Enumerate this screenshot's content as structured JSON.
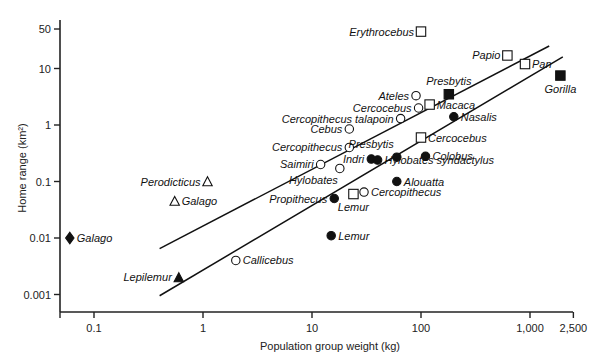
{
  "chart_data": {
    "type": "scatter",
    "title": "",
    "xlabel": "Population group weight (kg)",
    "ylabel": "Home range (km²)",
    "xscale": "log",
    "yscale": "log",
    "xlim": [
      0.05,
      2500
    ],
    "ylim": [
      0.0005,
      60
    ],
    "x_ticks": [
      {
        "value": 0.1,
        "label": "0.1"
      },
      {
        "value": 1,
        "label": "1"
      },
      {
        "value": 10,
        "label": "10"
      },
      {
        "value": 100,
        "label": "100"
      },
      {
        "value": 1000,
        "label": "1,000"
      },
      {
        "value": 2500,
        "label": "2,500"
      }
    ],
    "y_ticks": [
      {
        "value": 50,
        "label": "50"
      },
      {
        "value": 10,
        "label": "10"
      },
      {
        "value": 1,
        "label": "1"
      },
      {
        "value": 0.1,
        "label": "0.1"
      },
      {
        "value": 0.01,
        "label": "0.01"
      },
      {
        "value": 0.001,
        "label": "0.001"
      }
    ],
    "grid": false,
    "legend": "none",
    "marker_legend": {
      "open-circle": "series A",
      "filled-circle": "series B",
      "open-square": "series C",
      "filled-square": "series D",
      "open-triangle": "series E",
      "filled-triangle": "series F",
      "filled-diamond": "series G"
    },
    "points": [
      {
        "name": "Galago",
        "marker": "filled-diamond",
        "x": 0.06,
        "y": 0.01,
        "label_side": "right"
      },
      {
        "name": "Lepilemur",
        "marker": "filled-triangle",
        "x": 0.6,
        "y": 0.002,
        "label_side": "left"
      },
      {
        "name": "Perodicticus",
        "marker": "open-triangle",
        "x": 1.1,
        "y": 0.1,
        "label_side": "left"
      },
      {
        "name": "Galago",
        "marker": "open-triangle",
        "x": 0.55,
        "y": 0.045,
        "label_side": "right"
      },
      {
        "name": "Callicebus",
        "marker": "open-circle",
        "x": 2.0,
        "y": 0.004,
        "label_side": "right"
      },
      {
        "name": "Lemur",
        "marker": "filled-circle",
        "x": 15,
        "y": 0.011,
        "label_side": "right"
      },
      {
        "name": "Propithecus",
        "marker": "filled-circle",
        "x": 16,
        "y": 0.05,
        "label_side": "left"
      },
      {
        "name": "Lemur",
        "marker": "open-square",
        "x": 24,
        "y": 0.06,
        "label_side": "below"
      },
      {
        "name": "Cercopithecus",
        "marker": "open-circle",
        "x": 30,
        "y": 0.065,
        "label_side": "right"
      },
      {
        "name": "Hylobates",
        "marker": "open-circle",
        "x": 18,
        "y": 0.17,
        "label_side": "below-left"
      },
      {
        "name": "Saimiri",
        "marker": "open-circle",
        "x": 12,
        "y": 0.2,
        "label_side": "left"
      },
      {
        "name": "Cercopithecus",
        "marker": "open-circle",
        "x": 22,
        "y": 0.4,
        "label_side": "left"
      },
      {
        "name": "Indri",
        "marker": "filled-circle",
        "x": 35,
        "y": 0.25,
        "label_side": "left"
      },
      {
        "name": "Hylobates syndactylus",
        "marker": "filled-circle",
        "x": 40,
        "y": 0.24,
        "label_side": "right"
      },
      {
        "name": "Presbytis",
        "marker": "filled-circle",
        "x": 60,
        "y": 0.27,
        "label_side": "above-left"
      },
      {
        "name": "Alouatta",
        "marker": "filled-circle",
        "x": 60,
        "y": 0.1,
        "label_side": "right"
      },
      {
        "name": "Colobus",
        "marker": "filled-circle",
        "x": 110,
        "y": 0.28,
        "label_side": "right"
      },
      {
        "name": "Cercocebus",
        "marker": "open-square",
        "x": 100,
        "y": 0.6,
        "label_side": "right"
      },
      {
        "name": "Cebus",
        "marker": "open-circle",
        "x": 22,
        "y": 0.85,
        "label_side": "left"
      },
      {
        "name": "Cercopithecus talapoin",
        "marker": "open-circle",
        "x": 65,
        "y": 1.3,
        "label_side": "left"
      },
      {
        "name": "Ateles",
        "marker": "open-circle",
        "x": 90,
        "y": 3.3,
        "label_side": "left"
      },
      {
        "name": "Cercocebus",
        "marker": "open-circle",
        "x": 95,
        "y": 2.0,
        "label_side": "left"
      },
      {
        "name": "Macaca",
        "marker": "open-square",
        "x": 120,
        "y": 2.3,
        "label_side": "right"
      },
      {
        "name": "Presbytis",
        "marker": "filled-square",
        "x": 180,
        "y": 3.5,
        "label_side": "above"
      },
      {
        "name": "Nasalis",
        "marker": "filled-circle",
        "x": 200,
        "y": 1.4,
        "label_side": "right"
      },
      {
        "name": "Erythrocebus",
        "marker": "open-square",
        "x": 100,
        "y": 45,
        "label_side": "left"
      },
      {
        "name": "Papio",
        "marker": "open-square",
        "x": 620,
        "y": 17,
        "label_side": "left"
      },
      {
        "name": "Pan",
        "marker": "open-square",
        "x": 900,
        "y": 12,
        "label_side": "right"
      },
      {
        "name": "Gorilla",
        "marker": "filled-square",
        "x": 1900,
        "y": 7.5,
        "label_side": "below"
      }
    ],
    "lines": [
      {
        "name": "upper regression",
        "x": [
          0.4,
          1500
        ],
        "y": [
          0.0065,
          25
        ]
      },
      {
        "name": "lower regression",
        "x": [
          0.4,
          2000
        ],
        "y": [
          0.00095,
          16
        ]
      }
    ]
  }
}
